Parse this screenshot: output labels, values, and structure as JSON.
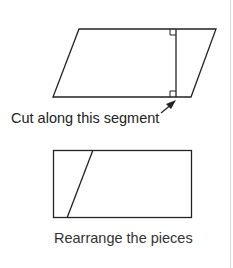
{
  "diagram": {
    "cut_label": "Cut along this segment",
    "rearrange_label": "Rearrange the pieces",
    "colors": {
      "stroke": "#222222",
      "text": "#222222",
      "border": "#d9d9d9"
    }
  }
}
